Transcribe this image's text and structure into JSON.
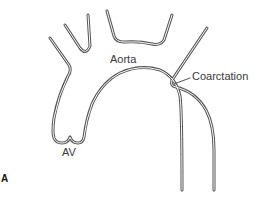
{
  "figure": {
    "panel_label": "A",
    "labels": {
      "aorta": "Aorta",
      "coarctation": "Coarctation",
      "aortic_valve": "AV"
    },
    "colors": {
      "line": "#555555",
      "text": "#3a3a3a",
      "background": "#ffffff"
    }
  }
}
